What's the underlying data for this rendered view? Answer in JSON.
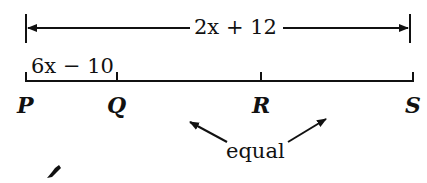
{
  "diagram": {
    "total_length_label": "2x + 12",
    "segment_pq_label": "6x − 10",
    "points": [
      {
        "name": "P",
        "x": 26
      },
      {
        "name": "Q",
        "x": 117
      },
      {
        "name": "R",
        "x": 261
      },
      {
        "name": "S",
        "x": 413
      }
    ],
    "annotation": "equal",
    "stroke_color": "#111111"
  }
}
